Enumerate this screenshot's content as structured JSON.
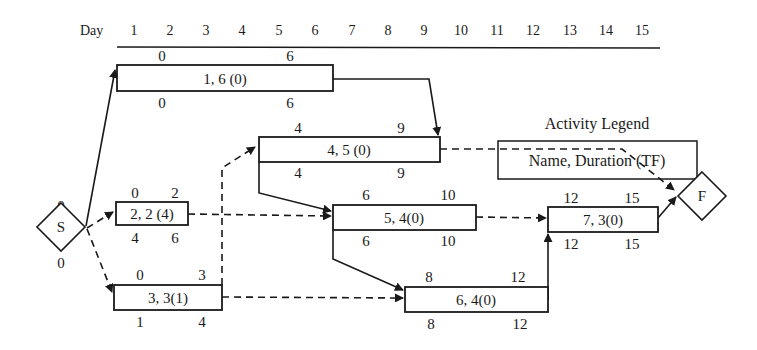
{
  "axis": {
    "label": "Day",
    "ticks": [
      "1",
      "2",
      "3",
      "4",
      "5",
      "6",
      "7",
      "8",
      "9",
      "10",
      "11",
      "12",
      "13",
      "14",
      "15"
    ]
  },
  "legend": {
    "title": "Activity Legend",
    "format": "Name, Duration (TF)"
  },
  "nodes": {
    "start": {
      "label": "S",
      "es": "0",
      "ls": "0"
    },
    "finish": {
      "label": "F"
    }
  },
  "activities": [
    {
      "id": "1",
      "text": "1, 6 (0)",
      "es": "0",
      "ef": "6",
      "ls": "0",
      "lf": "6"
    },
    {
      "id": "2",
      "text": "2, 2 (4)",
      "es": "0",
      "ef": "2",
      "ls": "4",
      "lf": "6"
    },
    {
      "id": "3",
      "text": "3, 3(1)",
      "es": "0",
      "ef": "3",
      "ls": "1",
      "lf": "4"
    },
    {
      "id": "4",
      "text": "4, 5 (0)",
      "es": "4",
      "ef": "9",
      "ls": "4",
      "lf": "9"
    },
    {
      "id": "5",
      "text": "5, 4(0)",
      "es": "6",
      "ef": "10",
      "ls": "6",
      "lf": "10"
    },
    {
      "id": "6",
      "text": "6, 4(0)",
      "es": "8",
      "ef": "12",
      "ls": "8",
      "lf": "12"
    },
    {
      "id": "7",
      "text": "7, 3(0)",
      "es": "12",
      "ef": "15",
      "ls": "12",
      "lf": "15"
    }
  ],
  "edges": [
    {
      "from": "S",
      "to": "1",
      "style": "solid"
    },
    {
      "from": "S",
      "to": "2",
      "style": "dashed"
    },
    {
      "from": "S",
      "to": "3",
      "style": "dashed"
    },
    {
      "from": "1",
      "to": "4",
      "style": "solid"
    },
    {
      "from": "3",
      "to": "4",
      "style": "dashed"
    },
    {
      "from": "2",
      "to": "5",
      "style": "dashed"
    },
    {
      "from": "4",
      "to": "5",
      "style": "solid"
    },
    {
      "from": "4",
      "to": "F",
      "style": "dashed"
    },
    {
      "from": "5",
      "to": "6",
      "style": "solid"
    },
    {
      "from": "3",
      "to": "6",
      "style": "dashed"
    },
    {
      "from": "5",
      "to": "7",
      "style": "dashed"
    },
    {
      "from": "6",
      "to": "7",
      "style": "solid"
    },
    {
      "from": "7",
      "to": "F",
      "style": "solid"
    }
  ]
}
